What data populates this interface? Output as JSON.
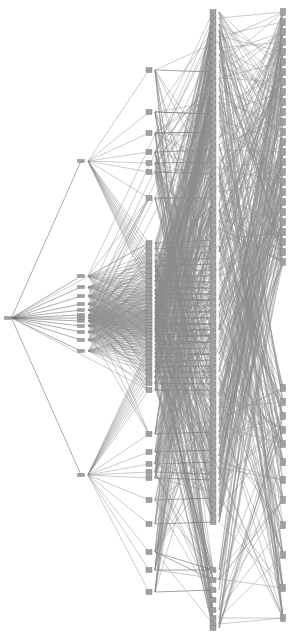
{
  "figure": {
    "title": "",
    "type": "layered-graph-visualization",
    "width": 288,
    "height": 635,
    "background_color": "#ffffff",
    "edge_color": "#8c8c8c",
    "edge_color_dark": "#666666",
    "node_color": "#a0a0a0",
    "node_stroke_color": "#777777",
    "edge_width": 0.45,
    "node_shape": "small-vertical-bar"
  },
  "chart_data": {
    "type": "scatter",
    "title": "",
    "xlabel": "",
    "ylabel": "",
    "grid": false,
    "legend_position": "none",
    "xlim": [
      0,
      288
    ],
    "ylim": [
      0,
      635
    ],
    "layers": [
      {
        "name": "layer-0-input",
        "x": 8,
        "node_count": 1,
        "node_w": 7,
        "node_h": 3,
        "nodes": [
          318
        ]
      },
      {
        "name": "layer-1",
        "x": 81,
        "node_count": 14,
        "node_w": 7,
        "node_h": 3,
        "nodes": [
          161,
          276,
          287,
          296,
          304,
          310,
          315,
          318,
          321,
          326,
          332,
          340,
          351,
          475
        ]
      },
      {
        "name": "layer-2",
        "x": 149,
        "node_count": 52,
        "node_w": 6,
        "node_h": 5,
        "nodes": [
          70,
          112,
          133,
          152,
          163,
          172,
          198,
          243,
          249,
          255,
          261,
          266,
          271,
          276,
          281,
          286,
          290,
          294,
          298,
          302,
          306,
          310,
          313,
          316,
          319,
          322,
          325,
          328,
          331,
          334,
          337,
          341,
          345,
          349,
          353,
          357,
          362,
          367,
          372,
          377,
          383,
          390,
          434,
          452,
          464,
          472,
          478,
          500,
          524,
          552,
          570,
          592
        ]
      },
      {
        "name": "layer-3",
        "x": 213,
        "node_count": 92,
        "node_w": 6,
        "node_h": 5,
        "nodes": [
          12,
          18,
          24,
          30,
          36,
          42,
          48,
          54,
          60,
          66,
          72,
          78,
          84,
          90,
          96,
          102,
          108,
          114,
          120,
          126,
          132,
          138,
          144,
          150,
          156,
          162,
          168,
          174,
          180,
          186,
          192,
          198,
          204,
          210,
          216,
          222,
          228,
          234,
          240,
          246,
          252,
          258,
          264,
          270,
          276,
          282,
          288,
          294,
          300,
          306,
          312,
          318,
          324,
          330,
          336,
          342,
          348,
          354,
          360,
          366,
          372,
          378,
          384,
          390,
          396,
          402,
          408,
          414,
          420,
          426,
          432,
          438,
          444,
          450,
          456,
          462,
          468,
          474,
          480,
          486,
          492,
          498,
          504,
          510,
          516,
          522,
          570,
          580,
          590,
          600,
          610,
          618,
          624,
          628
        ]
      },
      {
        "name": "layer-4-output",
        "x": 283,
        "node_count": 38,
        "node_w": 5,
        "node_h": 7,
        "nodes": [
          12,
          22,
          32,
          42,
          52,
          62,
          72,
          82,
          92,
          102,
          112,
          122,
          132,
          142,
          152,
          162,
          172,
          182,
          192,
          202,
          212,
          222,
          232,
          242,
          252,
          262,
          388,
          402,
          416,
          430,
          444,
          462,
          480,
          500,
          525,
          555,
          588,
          618
        ]
      }
    ],
    "edge_groups": [
      {
        "from": "layer-0-input",
        "to": "layer-1",
        "description": "single input fans out to all second-column nodes"
      },
      {
        "from": "layer-1",
        "to": "layer-2",
        "description": "dense fan-out from middle cluster, sparse from top/bottom hubs"
      },
      {
        "from": "layer-2",
        "to": "layer-3",
        "description": "very dense many-to-many bundle"
      },
      {
        "from": "layer-3",
        "to": "layer-4-output",
        "description": "dense crossing bundle to output column"
      }
    ]
  }
}
